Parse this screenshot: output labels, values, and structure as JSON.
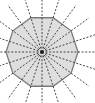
{
  "diagram": {
    "shape": "regular-decagon",
    "sides": 10,
    "center": [
      42,
      52
    ],
    "circumradius": 36,
    "rotation_deg": 0,
    "fill": "#dedede",
    "stroke": "#7a7a7a",
    "symmetry_lines": {
      "count": 20,
      "style": "dashed",
      "color": "#333333",
      "length": 58
    },
    "center_dot_color": "#222222"
  }
}
